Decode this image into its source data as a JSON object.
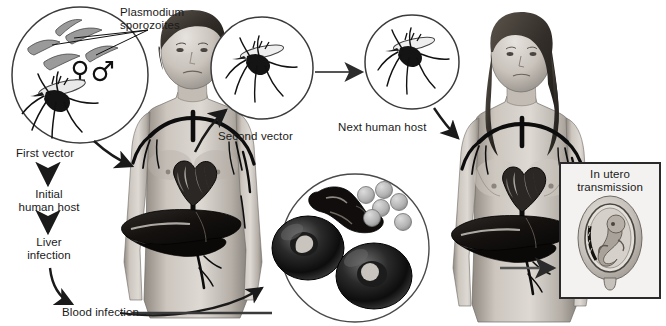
{
  "figure": {
    "background": "#ffffff",
    "ink": "#1a1a1a"
  },
  "labels": {
    "plasmodium": "Plasmodium\nsporozoites",
    "first_vector": "First vector",
    "initial_host": "Initial\nhuman host",
    "liver_infection": "Liver\ninfection",
    "blood_infection": "Blood infection",
    "second_vector": "Second vector",
    "next_human_host": "Next human host",
    "in_utero": "In utero\ntransmission",
    "female_symbol": "♀",
    "male_symbol": "♂"
  },
  "panels": [
    {
      "id": "first-vector-circle",
      "name": "first-vector-circle",
      "cx": 80,
      "cy": 75,
      "r": 68,
      "content": "mosquito-and-sporozoites"
    },
    {
      "id": "second-vector-circle",
      "name": "second-vector-circle",
      "cx": 262,
      "cy": 68,
      "r": 51,
      "content": "mosquito"
    },
    {
      "id": "next-host-circle",
      "name": "next-host-circle",
      "cx": 412,
      "cy": 62,
      "r": 47,
      "content": "mosquito"
    },
    {
      "id": "blood-cells-circle",
      "name": "blood-cells-circle",
      "cx": 355,
      "cy": 248,
      "r": 74,
      "content": "infected-red-blood-cells"
    },
    {
      "id": "in-utero-box",
      "name": "in-utero-box",
      "x": 560,
      "y": 163,
      "w": 100,
      "h": 135,
      "content": "fetus-in-womb"
    }
  ],
  "human_figures": [
    {
      "id": "initial-human-host",
      "name": "male-figure",
      "sex": "male",
      "organs": [
        "heart",
        "liver",
        "blood-vessels"
      ]
    },
    {
      "id": "next-human-host",
      "name": "female-figure",
      "sex": "female",
      "organs": [
        "heart",
        "liver",
        "blood-vessels"
      ]
    }
  ],
  "colors": {
    "ink": "#1a1a1a",
    "circle_stroke": "#3b3b3b",
    "skin_light": "#d8d4cf",
    "skin_mid": "#b9b3ac",
    "skin_dark": "#8d8781",
    "hair_dark": "#3a3530",
    "organ_dark": "#14100e",
    "vessel": "#0f0f0f",
    "cell_grey": "#b7b7b7",
    "box_stroke": "#2a2a2a"
  },
  "icons": {
    "arrow": "arrow-icon",
    "mosquito": "mosquito-icon",
    "sporozoite": "sporozoite-icon",
    "rbc": "red-blood-cell-icon",
    "fetus": "fetus-icon",
    "heart": "heart-icon",
    "liver": "liver-icon"
  },
  "arrows": [
    {
      "name": "arrow-first-vector-to-host",
      "kind": "curved"
    },
    {
      "name": "arrow-first-vector-down",
      "kind": "straight-down"
    },
    {
      "name": "arrow-initial-host-down",
      "kind": "straight-down"
    },
    {
      "name": "arrow-liver-to-blood",
      "kind": "curved"
    },
    {
      "name": "arrow-blood-to-cells",
      "kind": "curved"
    },
    {
      "name": "arrow-host-to-second-vector",
      "kind": "curved-up"
    },
    {
      "name": "arrow-second-to-next-vector",
      "kind": "straight-right"
    },
    {
      "name": "arrow-next-vector-to-woman",
      "kind": "curved-down"
    },
    {
      "name": "arrow-woman-to-in-utero",
      "kind": "straight-right"
    }
  ]
}
